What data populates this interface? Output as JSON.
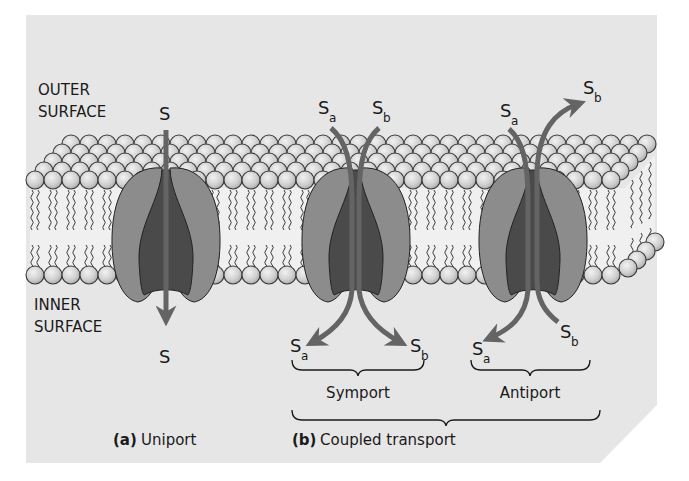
{
  "colors": {
    "page_bg": "#ffffff",
    "panel_bg": "#e6e6e6",
    "lipid_head_fill": "#d2d2d2",
    "lipid_head_stroke": "#3a3a3a",
    "lipid_tail": "#3a3a3a",
    "protein_outer": "#8c8c8c",
    "protein_inner": "#4a4a4a",
    "arrow": "#646464",
    "text": "#1a1a1a"
  },
  "labels": {
    "outer_surface_line1": "OUTER",
    "outer_surface_line2": "SURFACE",
    "inner_surface_line1": "INNER",
    "inner_surface_line2": "SURFACE"
  },
  "uniport": {
    "substrate_top": "S",
    "substrate_bottom": "S",
    "caption_letter": "(a)",
    "caption_text": "Uniport"
  },
  "symport": {
    "top_a": "S",
    "top_a_sub": "a",
    "top_b": "S",
    "top_b_sub": "b",
    "bottom_a": "S",
    "bottom_a_sub": "a",
    "bottom_b": "S",
    "bottom_b_sub": "b",
    "label": "Symport"
  },
  "antiport": {
    "top_a": "S",
    "top_a_sub": "a",
    "top_b": "S",
    "top_b_sub": "b",
    "bottom_a": "S",
    "bottom_a_sub": "a",
    "bottom_b": "S",
    "bottom_b_sub": "b",
    "label": "Antiport"
  },
  "coupled": {
    "caption_letter": "(b)",
    "caption_text": "Coupled transport"
  }
}
